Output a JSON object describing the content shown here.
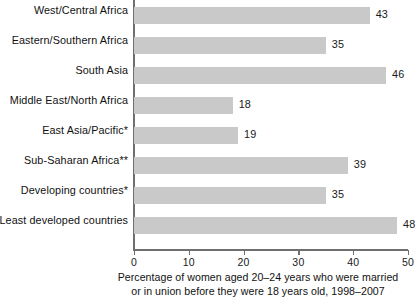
{
  "chart_data": {
    "type": "bar",
    "orientation": "horizontal",
    "title": "",
    "subtitle": "",
    "categories": [
      "West/Central Africa",
      "Eastern/Southern Africa",
      "South Asia",
      "Middle East/North Africa",
      "East Asia/Pacific*",
      "Sub-Saharan Africa**",
      "Developing countries*",
      "Least developed countries"
    ],
    "values": [
      43,
      35,
      46,
      18,
      19,
      39,
      35,
      48
    ],
    "value_labels": [
      "43",
      "35",
      "46",
      "18",
      "19",
      "39",
      "35",
      "48"
    ],
    "xlabel": "Percentage of women aged 20–24 years who were married or in union before they were 18 years old, 1998–2007",
    "ylabel": "",
    "xlim": [
      0,
      50
    ],
    "xticks": [
      0,
      10,
      20,
      30,
      40,
      50
    ],
    "xtick_labels": [
      "0",
      "10",
      "20",
      "30",
      "40",
      "50"
    ],
    "grid": false,
    "legend": "none",
    "bar_color": "#c9c9c9",
    "axis_color": "#6f6f6f",
    "text_color": "#111111",
    "background": "#ffffff"
  },
  "caption": {
    "line1": "Percentage of women aged 20–24 years who were married",
    "line2": "or in union before they were 18 years old, 1998–2007"
  }
}
